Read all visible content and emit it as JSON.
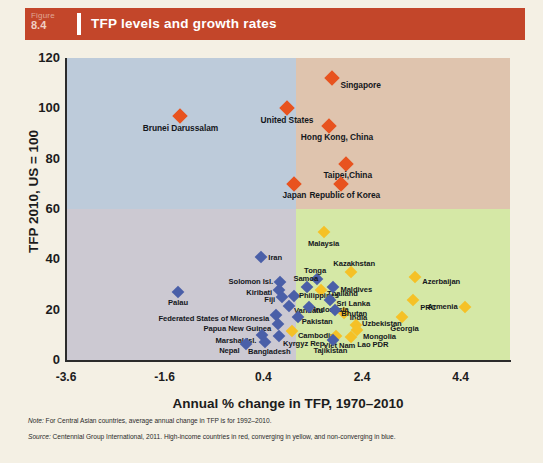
{
  "figure": {
    "badge_word": "Figure",
    "badge_number": "8.4",
    "title": "TFP levels and growth rates",
    "accent_color": "#c3462a"
  },
  "chart_data": {
    "type": "scatter",
    "title": "TFP levels and growth rates",
    "xlabel": "Annual % change in TFP, 1970–2010",
    "ylabel": "TFP 2010, US = 100",
    "xlim": [
      -3.6,
      5.4
    ],
    "ylim": [
      0,
      120
    ],
    "xticks": [
      "-3.6",
      "-1.6",
      "0.4",
      "2.4",
      "4.4"
    ],
    "xtick_values": [
      -3.6,
      -1.6,
      0.4,
      2.4,
      4.4
    ],
    "yticks": [
      "0",
      "20",
      "40",
      "60",
      "80",
      "100",
      "120"
    ],
    "ytick_values": [
      0,
      20,
      40,
      60,
      80,
      100,
      120
    ],
    "grid": false,
    "legend": "none",
    "quadrants": {
      "x_divider": 1.07,
      "y_divider": 60,
      "top_left_color": "#bdcbda",
      "top_right_color": "#dfc4ae",
      "bottom_left_color": "#ccc9d2",
      "bottom_right_color": "#d5e8a6"
    },
    "series": [
      {
        "name": "High-income countries",
        "color": "#e8531f",
        "marker": "diamond",
        "points": [
          {
            "label": "Brunei Darussalam",
            "x": -1.28,
            "y": 97.0,
            "anchor": "c",
            "dx": 0,
            "dy": 12,
            "size": "big"
          },
          {
            "label": "United States",
            "x": 0.88,
            "y": 100.0,
            "anchor": "c",
            "dx": 0,
            "dy": 12,
            "size": "big"
          },
          {
            "label": "Singapore",
            "x": 1.8,
            "y": 112.0,
            "anchor": "r",
            "dx": 8,
            "dy": 7,
            "size": "big"
          },
          {
            "label": "Hong Kong, China",
            "x": 1.73,
            "y": 93.0,
            "anchor": "c",
            "dx": 8,
            "dy": 11,
            "size": "big"
          },
          {
            "label": "Taipei,China",
            "x": 2.07,
            "y": 78.0,
            "anchor": "c",
            "dx": 2,
            "dy": 11,
            "size": "big"
          },
          {
            "label": "Republic of Korea",
            "x": 1.97,
            "y": 70.0,
            "anchor": "c",
            "dx": 4,
            "dy": 11,
            "size": "big"
          },
          {
            "label": "Japan",
            "x": 1.03,
            "y": 70.0,
            "anchor": "c",
            "dx": 0,
            "dy": 11,
            "size": "big"
          }
        ]
      },
      {
        "name": "Converging countries",
        "color": "#f5c127",
        "marker": "diamond",
        "points": [
          {
            "label": "Malaysia",
            "x": 1.62,
            "y": 51.0,
            "anchor": "c",
            "dx": 0,
            "dy": 11
          },
          {
            "label": "Kazakhstan",
            "x": 2.18,
            "y": 35.0,
            "anchor": "c",
            "dx": 3,
            "dy": -9
          },
          {
            "label": "Azerbaijan",
            "x": 3.48,
            "y": 33.0,
            "anchor": "r",
            "dx": 7,
            "dy": 4
          },
          {
            "label": "Thailand",
            "x": 1.57,
            "y": 28.0,
            "anchor": "r",
            "dx": 6,
            "dy": 3
          },
          {
            "label": "PRC",
            "x": 3.44,
            "y": 24.0,
            "anchor": "r",
            "dx": 7,
            "dy": 7
          },
          {
            "label": "Armenia",
            "x": 4.48,
            "y": 21.0,
            "anchor": "l",
            "dx": -7,
            "dy": -1
          },
          {
            "label": "India",
            "x": 2.03,
            "y": 18.5,
            "anchor": "r",
            "dx": 6,
            "dy": 4
          },
          {
            "label": "Georgia",
            "x": 3.22,
            "y": 17.0,
            "anchor": "c",
            "dx": 2,
            "dy": 11
          },
          {
            "label": "Uzbekistan",
            "x": 2.28,
            "y": 14.0,
            "anchor": "r",
            "dx": 6,
            "dy": -2
          },
          {
            "label": "Mongolia",
            "x": 2.3,
            "y": 12.0,
            "anchor": "r",
            "dx": 6,
            "dy": 6
          },
          {
            "label": "Cambodia",
            "x": 0.98,
            "y": 11.5,
            "anchor": "r",
            "dx": 6,
            "dy": 4
          },
          {
            "label": "Viet Nam",
            "x": 1.88,
            "y": 9.5,
            "anchor": "c",
            "dx": 3,
            "dy": 9
          },
          {
            "label": "Lao PDR",
            "x": 2.18,
            "y": 9.0,
            "anchor": "r",
            "dx": 6,
            "dy": 7
          }
        ]
      },
      {
        "name": "Non-converging countries",
        "color": "#4a5fa8",
        "marker": "diamond",
        "points": [
          {
            "label": "Iran",
            "x": 0.36,
            "y": 41.0,
            "anchor": "r",
            "dx": 7,
            "dy": 0
          },
          {
            "label": "Solomon Isl.",
            "x": 0.74,
            "y": 31.0,
            "anchor": "l",
            "dx": -7,
            "dy": -1
          },
          {
            "label": "Tonga",
            "x": 1.49,
            "y": 32.0,
            "anchor": "c",
            "dx": -2,
            "dy": -9
          },
          {
            "label": "Maldives",
            "x": 1.82,
            "y": 29.0,
            "anchor": "r",
            "dx": 7,
            "dy": 2
          },
          {
            "label": "Kiribati",
            "x": 0.72,
            "y": 28.0,
            "anchor": "l",
            "dx": -7,
            "dy": 2
          },
          {
            "label": "Samoa",
            "x": 1.28,
            "y": 29.0,
            "anchor": "c",
            "dx": -1,
            "dy": -9
          },
          {
            "label": "Palau",
            "x": -1.33,
            "y": 27.0,
            "anchor": "c",
            "dx": 0,
            "dy": 10
          },
          {
            "label": "Fiji",
            "x": 0.78,
            "y": 25.0,
            "anchor": "l",
            "dx": -7,
            "dy": 2
          },
          {
            "label": "Philippines",
            "x": 1.02,
            "y": 25.5,
            "anchor": "r",
            "dx": 5,
            "dy": -1
          },
          {
            "label": "Sri Lanka",
            "x": 1.76,
            "y": 24.0,
            "anchor": "r",
            "dx": 6,
            "dy": 3
          },
          {
            "label": "Vanuatu",
            "x": 0.92,
            "y": 21.5,
            "anchor": "r",
            "dx": 5,
            "dy": 4
          },
          {
            "label": "Indonesia",
            "x": 1.32,
            "y": 21.0,
            "anchor": "r",
            "dx": 5,
            "dy": 2
          },
          {
            "label": "Bhutan",
            "x": 1.86,
            "y": 20.0,
            "anchor": "r",
            "dx": 6,
            "dy": 3
          },
          {
            "label": "Federated States of Micronesia",
            "x": 0.66,
            "y": 18.0,
            "anchor": "l",
            "dx": -7,
            "dy": 3
          },
          {
            "label": "Pakistan",
            "x": 1.1,
            "y": 17.0,
            "anchor": "r",
            "dx": 4,
            "dy": 4
          },
          {
            "label": "Papua New Guinea",
            "x": 0.7,
            "y": 14.5,
            "anchor": "l",
            "dx": -7,
            "dy": 4
          },
          {
            "label": "Kyrgyz Rep.",
            "x": 0.72,
            "y": 9.5,
            "anchor": "r",
            "dx": 4,
            "dy": 7
          },
          {
            "label": "Marshal Isl.",
            "x": 0.38,
            "y": 10.0,
            "anchor": "l",
            "dx": -6,
            "dy": 5
          },
          {
            "label": "Bangladesh",
            "x": 0.44,
            "y": 7.0,
            "anchor": "c",
            "dx": 4,
            "dy": 9
          },
          {
            "label": "Nepal",
            "x": 0.04,
            "y": 6.5,
            "anchor": "l",
            "dx": -6,
            "dy": 6
          },
          {
            "label": "Tajikistan",
            "x": 1.82,
            "y": 8.0,
            "anchor": "c",
            "dx": -3,
            "dy": 10
          }
        ]
      }
    ]
  },
  "notes": {
    "note_prefix": "Note:",
    "note_text": " For Central Asian countries, average annual change in TFP is for 1992–2010.",
    "source_prefix": "Source:",
    "source_text": " Centennial Group International, 2011. High-income countries in red, converging in yellow, and non-converging in blue."
  }
}
